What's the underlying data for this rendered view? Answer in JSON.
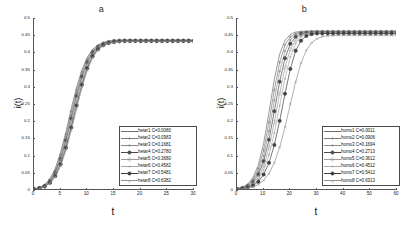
{
  "figure": {
    "width": 407,
    "height": 233,
    "background": "#ffffff"
  },
  "panels": [
    {
      "id": "panel-a",
      "title": "a",
      "xlabel": "t",
      "ylabel": "i(t)",
      "chart_data": {
        "type": "line",
        "title": "a",
        "xlabel": "t",
        "ylabel": "i(t)",
        "xlim": [
          0,
          30
        ],
        "ylim": [
          0,
          0.5
        ],
        "xticks": [
          0,
          5,
          10,
          15,
          20,
          25,
          30
        ],
        "xtick_labels": [
          "0",
          "5",
          "10",
          "15",
          "20",
          "25",
          "30"
        ],
        "yticks": [
          0,
          0.05,
          0.1,
          0.15,
          0.2,
          0.25,
          0.3,
          0.35,
          0.4,
          0.45,
          0.5
        ],
        "ytick_labels": [
          "0",
          "0.05",
          "0.1",
          "0.15",
          "0.2",
          "0.25",
          "0.3",
          "0.35",
          "0.4",
          "0.45",
          "0.5"
        ],
        "grid": false,
        "legend_position": "lower-right",
        "saturation_value": 0.435,
        "x": [
          0,
          1,
          2,
          3,
          4,
          5,
          6,
          7,
          8,
          9,
          10,
          11,
          12,
          13,
          14,
          15,
          16,
          17,
          18,
          19,
          20,
          21,
          22,
          23,
          24,
          25,
          26,
          27,
          28,
          29,
          30
        ],
        "series": [
          {
            "name": "hetar1 C=0.0080",
            "label": "hetar1",
            "C": 0.008,
            "color": "#6f6f6f",
            "marker": "none",
            "midpoint": 7.3,
            "rate": 0.62,
            "plateau": 0.436,
            "values": [
              0.003,
              0.007,
              0.015,
              0.033,
              0.063,
              0.11,
              0.17,
              0.238,
              0.3,
              0.35,
              0.386,
              0.409,
              0.422,
              0.429,
              0.433,
              0.435,
              0.436,
              0.436,
              0.436,
              0.436,
              0.436,
              0.436,
              0.436,
              0.436,
              0.436,
              0.436,
              0.436,
              0.436,
              0.436,
              0.436,
              0.436
            ]
          },
          {
            "name": "hetar2 C=0.0983",
            "label": "hetar2",
            "C": 0.0983,
            "color": "#7a7a7a",
            "marker": "plus",
            "midpoint": 7.5,
            "rate": 0.61,
            "plateau": 0.435,
            "values": [
              0.003,
              0.006,
              0.014,
              0.03,
              0.058,
              0.103,
              0.161,
              0.228,
              0.291,
              0.343,
              0.381,
              0.406,
              0.42,
              0.428,
              0.432,
              0.434,
              0.435,
              0.435,
              0.435,
              0.435,
              0.435,
              0.435,
              0.435,
              0.435,
              0.435,
              0.435,
              0.435,
              0.435,
              0.435,
              0.435,
              0.435
            ]
          },
          {
            "name": "hetar3 C=0.1681",
            "label": "hetar3",
            "C": 0.1681,
            "color": "#8a8a8a",
            "marker": "star",
            "midpoint": 7.7,
            "rate": 0.6,
            "plateau": 0.435,
            "values": [
              0.003,
              0.006,
              0.013,
              0.028,
              0.054,
              0.096,
              0.152,
              0.218,
              0.282,
              0.336,
              0.376,
              0.403,
              0.418,
              0.427,
              0.431,
              0.434,
              0.435,
              0.435,
              0.435,
              0.435,
              0.435,
              0.435,
              0.435,
              0.435,
              0.435,
              0.435,
              0.435,
              0.435,
              0.435,
              0.435,
              0.435
            ]
          },
          {
            "name": "hetar4 C=0.2780",
            "label": "hetar4",
            "C": 0.278,
            "color": "#4a4a4a",
            "marker": "circle-dot",
            "midpoint": 7.9,
            "rate": 0.59,
            "plateau": 0.434,
            "values": [
              0.003,
              0.006,
              0.012,
              0.026,
              0.05,
              0.09,
              0.144,
              0.208,
              0.273,
              0.329,
              0.371,
              0.4,
              0.416,
              0.425,
              0.43,
              0.433,
              0.434,
              0.434,
              0.434,
              0.434,
              0.434,
              0.434,
              0.434,
              0.434,
              0.434,
              0.434,
              0.434,
              0.434,
              0.434,
              0.434,
              0.434
            ]
          },
          {
            "name": "hetar5 C=0.3680",
            "label": "hetar5",
            "C": 0.368,
            "color": "#9a9a9a",
            "marker": "circle",
            "midpoint": 8.1,
            "rate": 0.58,
            "plateau": 0.434,
            "values": [
              0.002,
              0.005,
              0.011,
              0.024,
              0.047,
              0.085,
              0.137,
              0.199,
              0.264,
              0.322,
              0.366,
              0.396,
              0.414,
              0.424,
              0.429,
              0.432,
              0.433,
              0.434,
              0.434,
              0.434,
              0.434,
              0.434,
              0.434,
              0.434,
              0.434,
              0.434,
              0.434,
              0.434,
              0.434,
              0.434,
              0.434
            ]
          },
          {
            "name": "hetar6 C=0.4582",
            "label": "hetar6",
            "C": 0.4582,
            "color": "#a5a5a5",
            "marker": "dot",
            "midpoint": 8.3,
            "rate": 0.57,
            "plateau": 0.433,
            "values": [
              0.002,
              0.005,
              0.011,
              0.023,
              0.044,
              0.08,
              0.13,
              0.191,
              0.255,
              0.314,
              0.36,
              0.393,
              0.412,
              0.422,
              0.428,
              0.431,
              0.432,
              0.433,
              0.433,
              0.433,
              0.433,
              0.433,
              0.433,
              0.433,
              0.433,
              0.433,
              0.433,
              0.433,
              0.433,
              0.433,
              0.433
            ]
          },
          {
            "name": "hetar7 C=0.5481",
            "label": "hetar7",
            "C": 0.5481,
            "color": "#3f3f3f",
            "marker": "circle-dot",
            "midpoint": 8.5,
            "rate": 0.56,
            "plateau": 0.433,
            "values": [
              0.002,
              0.005,
              0.01,
              0.021,
              0.041,
              0.075,
              0.123,
              0.182,
              0.246,
              0.306,
              0.354,
              0.389,
              0.409,
              0.421,
              0.427,
              0.43,
              0.432,
              0.433,
              0.433,
              0.433,
              0.433,
              0.433,
              0.433,
              0.433,
              0.433,
              0.433,
              0.433,
              0.433,
              0.433,
              0.433,
              0.433
            ]
          },
          {
            "name": "hetar8 C=0.6382",
            "label": "hetar8",
            "C": 0.6382,
            "color": "#8f8f8f",
            "marker": "x",
            "midpoint": 8.7,
            "rate": 0.55,
            "plateau": 0.432,
            "values": [
              0.002,
              0.004,
              0.009,
              0.02,
              0.038,
              0.07,
              0.116,
              0.173,
              0.237,
              0.298,
              0.348,
              0.385,
              0.407,
              0.419,
              0.426,
              0.429,
              0.431,
              0.432,
              0.432,
              0.432,
              0.432,
              0.432,
              0.432,
              0.432,
              0.432,
              0.432,
              0.432,
              0.432,
              0.432,
              0.432,
              0.432
            ]
          }
        ]
      }
    },
    {
      "id": "panel-b",
      "title": "b",
      "xlabel": "t",
      "ylabel": "i(t)",
      "chart_data": {
        "type": "line",
        "title": "b",
        "xlabel": "t",
        "ylabel": "i(t)",
        "xlim": [
          0,
          60
        ],
        "ylim": [
          0,
          0.5
        ],
        "xticks": [
          0,
          10,
          20,
          30,
          40,
          50,
          60
        ],
        "xtick_labels": [
          "0",
          "10",
          "20",
          "30",
          "40",
          "50",
          "60"
        ],
        "yticks": [
          0,
          0.05,
          0.1,
          0.15,
          0.2,
          0.25,
          0.3,
          0.35,
          0.4,
          0.45,
          0.5
        ],
        "ytick_labels": [
          "0",
          "0.05",
          "0.1",
          "0.15",
          "0.2",
          "0.25",
          "0.3",
          "0.35",
          "0.4",
          "0.45",
          "0.5"
        ],
        "grid": false,
        "legend_position": "lower-right",
        "saturation_value": 0.46,
        "x": [
          0,
          2,
          4,
          6,
          8,
          10,
          12,
          14,
          16,
          18,
          20,
          22,
          24,
          26,
          28,
          30,
          32,
          34,
          36,
          38,
          40,
          42,
          44,
          46,
          48,
          50,
          52,
          54,
          56,
          58,
          60
        ],
        "series": [
          {
            "name": "homo1 C=0.0011",
            "label": "homo1",
            "C": 0.0011,
            "color": "#6f6f6f",
            "marker": "none",
            "midpoint": 12.5,
            "rate": 0.38,
            "plateau": 0.462,
            "values": [
              0.004,
              0.008,
              0.017,
              0.036,
              0.073,
              0.136,
              0.226,
              0.322,
              0.395,
              0.435,
              0.452,
              0.459,
              0.461,
              0.462,
              0.462,
              0.462,
              0.462,
              0.462,
              0.462,
              0.462,
              0.462,
              0.462,
              0.462,
              0.462,
              0.462,
              0.462,
              0.462,
              0.462,
              0.462,
              0.462,
              0.462
            ]
          },
          {
            "name": "homo2 C=0.0906",
            "label": "homo2",
            "C": 0.0906,
            "color": "#7c7c7c",
            "marker": "plus",
            "midpoint": 14.0,
            "rate": 0.36,
            "plateau": 0.461,
            "values": [
              0.004,
              0.007,
              0.015,
              0.031,
              0.062,
              0.116,
              0.197,
              0.291,
              0.371,
              0.422,
              0.445,
              0.455,
              0.459,
              0.46,
              0.461,
              0.461,
              0.461,
              0.461,
              0.461,
              0.461,
              0.461,
              0.461,
              0.461,
              0.461,
              0.461,
              0.461,
              0.461,
              0.461,
              0.461,
              0.461,
              0.461
            ]
          },
          {
            "name": "homo3 C=0.1694",
            "label": "homo3",
            "C": 0.1694,
            "color": "#8c8c8c",
            "marker": "star",
            "midpoint": 15.8,
            "rate": 0.34,
            "plateau": 0.46,
            "values": [
              0.003,
              0.006,
              0.013,
              0.027,
              0.053,
              0.099,
              0.171,
              0.261,
              0.345,
              0.404,
              0.436,
              0.451,
              0.457,
              0.459,
              0.46,
              0.46,
              0.46,
              0.46,
              0.46,
              0.46,
              0.46,
              0.46,
              0.46,
              0.46,
              0.46,
              0.46,
              0.46,
              0.46,
              0.46,
              0.46,
              0.46
            ]
          },
          {
            "name": "homo4 C=0.2713",
            "label": "homo4",
            "C": 0.2713,
            "color": "#4a4a4a",
            "marker": "circle-dot",
            "midpoint": 17.8,
            "rate": 0.32,
            "plateau": 0.459,
            "values": [
              0.003,
              0.006,
              0.011,
              0.023,
              0.045,
              0.084,
              0.146,
              0.229,
              0.315,
              0.383,
              0.425,
              0.445,
              0.454,
              0.457,
              0.458,
              0.459,
              0.459,
              0.459,
              0.459,
              0.459,
              0.459,
              0.459,
              0.459,
              0.459,
              0.459,
              0.459,
              0.459,
              0.459,
              0.459,
              0.459,
              0.459
            ]
          },
          {
            "name": "homo5 C=0.3612",
            "label": "homo5",
            "C": 0.3612,
            "color": "#9c9c9c",
            "marker": "circle",
            "midpoint": 20.0,
            "rate": 0.3,
            "plateau": 0.458,
            "values": [
              0.003,
              0.005,
              0.01,
              0.019,
              0.037,
              0.07,
              0.123,
              0.197,
              0.28,
              0.356,
              0.409,
              0.437,
              0.45,
              0.455,
              0.457,
              0.458,
              0.458,
              0.458,
              0.458,
              0.458,
              0.458,
              0.458,
              0.458,
              0.458,
              0.458,
              0.458,
              0.458,
              0.458,
              0.458,
              0.458,
              0.458
            ]
          },
          {
            "name": "homo6 C=0.4512",
            "label": "homo6",
            "C": 0.4512,
            "color": "#a8a8a8",
            "marker": "dot",
            "midpoint": 22.5,
            "rate": 0.28,
            "plateau": 0.457,
            "values": [
              0.002,
              0.004,
              0.008,
              0.016,
              0.031,
              0.058,
              0.102,
              0.166,
              0.245,
              0.324,
              0.387,
              0.426,
              0.445,
              0.453,
              0.456,
              0.457,
              0.457,
              0.457,
              0.457,
              0.457,
              0.457,
              0.457,
              0.457,
              0.457,
              0.457,
              0.457,
              0.457,
              0.457,
              0.457,
              0.457,
              0.457
            ]
          },
          {
            "name": "homo7 C=0.5412",
            "label": "homo7",
            "C": 0.5412,
            "color": "#3f3f3f",
            "marker": "circle-dot",
            "midpoint": 26.0,
            "rate": 0.25,
            "plateau": 0.455,
            "values": [
              0.002,
              0.004,
              0.007,
              0.013,
              0.024,
              0.045,
              0.079,
              0.131,
              0.201,
              0.28,
              0.352,
              0.405,
              0.434,
              0.448,
              0.453,
              0.455,
              0.455,
              0.455,
              0.455,
              0.455,
              0.455,
              0.455,
              0.455,
              0.455,
              0.455,
              0.455,
              0.455,
              0.455,
              0.455,
              0.455,
              0.455
            ]
          },
          {
            "name": "homo8 C=0.6313",
            "label": "homo8",
            "C": 0.6313,
            "color": "#909090",
            "marker": "x",
            "midpoint": 33.0,
            "rate": 0.21,
            "plateau": 0.45,
            "values": [
              0.002,
              0.003,
              0.005,
              0.009,
              0.016,
              0.028,
              0.048,
              0.079,
              0.124,
              0.183,
              0.25,
              0.314,
              0.369,
              0.406,
              0.428,
              0.44,
              0.446,
              0.448,
              0.449,
              0.45,
              0.45,
              0.45,
              0.45,
              0.45,
              0.45,
              0.45,
              0.45,
              0.45,
              0.45,
              0.45,
              0.45
            ]
          }
        ]
      }
    }
  ]
}
